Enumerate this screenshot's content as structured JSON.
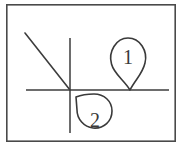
{
  "canvas": {
    "width": 184,
    "height": 156,
    "background": "#ffffff",
    "ink_color": "#3d3d3d",
    "frame_color": "#4a4a4a"
  },
  "frame": {
    "name": "drawing border",
    "x": 6,
    "y": 4,
    "width": 170,
    "height": 138
  },
  "diagram": {
    "type": "hand-drawn geometry sketch",
    "horizontal_line": {
      "x1": 26,
      "y1": 90,
      "x2": 169,
      "y2": 90
    },
    "vertical_line": {
      "x1": 70,
      "y1": 38,
      "x2": 70,
      "y2": 133
    },
    "diagonal_line": {
      "x1": 25,
      "y1": 33,
      "x2": 70,
      "y2": 90
    },
    "intersection": {
      "x": 70,
      "y": 90
    }
  },
  "markers": [
    {
      "id": "marker-1",
      "label": "1",
      "shape": "teardrop-pin",
      "direction": "down",
      "circle": {
        "cx": 128,
        "cy": 56,
        "r": 18
      },
      "tip": {
        "x": 130,
        "y": 90
      },
      "label_x": 128,
      "label_y": 57
    },
    {
      "id": "marker-2",
      "label": "2",
      "shape": "teardrop-pin",
      "direction": "up-left",
      "circle": {
        "cx": 95,
        "cy": 119,
        "r": 17
      },
      "tip": {
        "x": 76,
        "y": 97
      },
      "label_x": 95,
      "label_y": 120
    }
  ]
}
